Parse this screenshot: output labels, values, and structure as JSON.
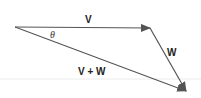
{
  "diagram": {
    "labels": {
      "v": "V",
      "w": "W",
      "sum": "V + W",
      "angle": "θ"
    },
    "colors": {
      "stroke": "#555555",
      "text": "#222222",
      "faint_line": "#e6e6e6"
    },
    "vectors": [
      {
        "name": "V",
        "from": [
          15,
          27
        ],
        "to": [
          150,
          28
        ]
      },
      {
        "name": "W",
        "from": [
          150,
          28
        ],
        "to": [
          187,
          92
        ]
      },
      {
        "name": "V + W",
        "from": [
          15,
          27
        ],
        "to": [
          187,
          92
        ]
      }
    ]
  }
}
